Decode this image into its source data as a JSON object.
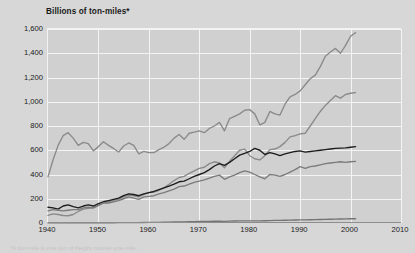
{
  "figure": {
    "background_color": "#d7d7d7",
    "plot_background_color": "#d0d0d0",
    "grid_color": "#f4f4f4",
    "axis_title": "Billions of ton-miles*",
    "footnote": "*A ton-mile is one ton of freight moved one mile."
  },
  "chart_data": {
    "type": "line",
    "title": "Billions of ton-miles*",
    "xlabel": "",
    "ylabel": "Billions of ton-miles*",
    "xlim": [
      1940,
      2010
    ],
    "ylim": [
      0,
      1600
    ],
    "xticks": [
      "1940",
      "1950",
      "1960",
      "1970",
      "1980",
      "1990",
      "2000",
      "2010"
    ],
    "yticks": [
      "0",
      "200",
      "400",
      "600",
      "800",
      "1,000",
      "1,200",
      "1,400",
      "1,600"
    ],
    "grid": true,
    "legend_position": "none",
    "x": [
      1940,
      1941,
      1942,
      1943,
      1944,
      1945,
      1946,
      1947,
      1948,
      1949,
      1950,
      1951,
      1952,
      1953,
      1954,
      1955,
      1956,
      1957,
      1958,
      1959,
      1960,
      1961,
      1962,
      1963,
      1964,
      1965,
      1966,
      1967,
      1968,
      1969,
      1970,
      1971,
      1972,
      1973,
      1974,
      1975,
      1976,
      1977,
      1978,
      1979,
      1980,
      1981,
      1982,
      1983,
      1984,
      1985,
      1986,
      1987,
      1988,
      1989,
      1990,
      1991,
      1992,
      1993,
      1994,
      1995,
      1996,
      1997,
      1998,
      1999,
      2000,
      2001
    ],
    "series": [
      {
        "name": "rail",
        "color": "#8a8a8a",
        "values": [
          380,
          520,
          640,
          720,
          745,
          700,
          640,
          665,
          655,
          595,
          630,
          670,
          640,
          615,
          585,
          635,
          660,
          640,
          570,
          590,
          580,
          580,
          605,
          625,
          655,
          700,
          730,
          690,
          740,
          750,
          760,
          745,
          780,
          800,
          830,
          760,
          860,
          880,
          900,
          930,
          935,
          900,
          810,
          830,
          920,
          900,
          890,
          980,
          1040,
          1060,
          1090,
          1140,
          1190,
          1220,
          1290,
          1375,
          1410,
          1440,
          1400,
          1465,
          1540,
          1570
        ]
      },
      {
        "name": "truck",
        "color": "#8a8a8a",
        "values": [
          62,
          75,
          70,
          62,
          60,
          70,
          95,
          115,
          120,
          125,
          145,
          165,
          175,
          190,
          195,
          215,
          230,
          225,
          215,
          235,
          250,
          255,
          270,
          290,
          320,
          350,
          375,
          385,
          410,
          430,
          450,
          460,
          490,
          505,
          495,
          455,
          510,
          555,
          600,
          610,
          555,
          530,
          520,
          555,
          605,
          610,
          630,
          665,
          710,
          720,
          735,
          740,
          800,
          860,
          920,
          970,
          1010,
          1050,
          1030,
          1060,
          1070,
          1075
        ]
      },
      {
        "name": "pipeline",
        "color": "#1c1c1c",
        "values": [
          130,
          125,
          115,
          140,
          150,
          135,
          125,
          140,
          150,
          140,
          160,
          175,
          185,
          195,
          205,
          225,
          240,
          235,
          225,
          240,
          250,
          260,
          275,
          290,
          305,
          320,
          340,
          345,
          365,
          385,
          400,
          415,
          440,
          470,
          490,
          475,
          500,
          530,
          560,
          575,
          590,
          615,
          600,
          565,
          580,
          570,
          555,
          570,
          580,
          590,
          595,
          585,
          590,
          595,
          600,
          605,
          610,
          615,
          618,
          620,
          625,
          630
        ]
      },
      {
        "name": "water",
        "color": "#7b7b7b",
        "values": [
          100,
          110,
          105,
          100,
          105,
          110,
          110,
          125,
          130,
          125,
          145,
          165,
          165,
          175,
          185,
          200,
          215,
          205,
          195,
          215,
          220,
          225,
          240,
          250,
          265,
          280,
          300,
          305,
          320,
          335,
          345,
          355,
          370,
          385,
          395,
          360,
          380,
          395,
          415,
          430,
          420,
          400,
          380,
          365,
          400,
          395,
          385,
          400,
          420,
          440,
          465,
          450,
          465,
          470,
          480,
          490,
          495,
          500,
          505,
          500,
          505,
          508
        ]
      },
      {
        "name": "air",
        "color": "#747474",
        "values": [
          0.5,
          0.6,
          0.7,
          0.8,
          0.9,
          1,
          1.2,
          1.3,
          1.4,
          1.5,
          1.8,
          2,
          2.2,
          2.4,
          2.6,
          3,
          3.3,
          3.5,
          3.6,
          4,
          4.5,
          5,
          5.5,
          6,
          7,
          8,
          9,
          9.5,
          10,
          11,
          12,
          12.5,
          13.5,
          14.5,
          15,
          14,
          15.5,
          16.5,
          17.5,
          18,
          17.5,
          18,
          17.5,
          18.5,
          20,
          21,
          22,
          23,
          24,
          25,
          26,
          25.5,
          26.5,
          27.5,
          29,
          30,
          31,
          32,
          33,
          34,
          35,
          35
        ]
      }
    ]
  }
}
